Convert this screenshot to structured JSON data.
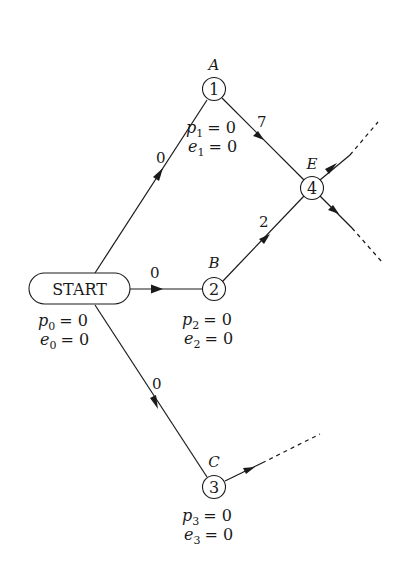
{
  "diagram": {
    "start": {
      "label": "START",
      "p": "p",
      "p_sub": "0",
      "e": "e",
      "e_sub": "0",
      "val": "= 0"
    },
    "nodes": [
      {
        "id": "1",
        "name": "A",
        "p_sub": "1",
        "e_sub": "1",
        "val": "= 0"
      },
      {
        "id": "2",
        "name": "B",
        "p_sub": "2",
        "e_sub": "2",
        "val": "= 0"
      },
      {
        "id": "3",
        "name": "C",
        "p_sub": "3",
        "e_sub": "3",
        "val": "= 0"
      },
      {
        "id": "4",
        "name": "E"
      }
    ],
    "edges": [
      {
        "from": "START",
        "to": "1",
        "weight": "0"
      },
      {
        "from": "START",
        "to": "2",
        "weight": "0"
      },
      {
        "from": "START",
        "to": "3",
        "weight": "0"
      },
      {
        "from": "1",
        "to": "4",
        "weight": "7"
      },
      {
        "from": "2",
        "to": "4",
        "weight": "2"
      },
      {
        "from": "4",
        "to": "out-up",
        "weight": ""
      },
      {
        "from": "4",
        "to": "out-down",
        "weight": ""
      },
      {
        "from": "3",
        "to": "out",
        "weight": ""
      }
    ],
    "p_letter": "p",
    "e_letter": "e"
  }
}
